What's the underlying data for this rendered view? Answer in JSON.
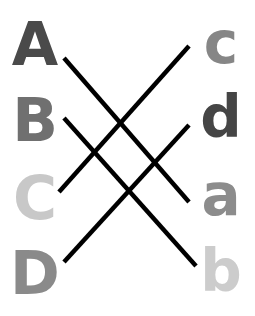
{
  "left_column": [
    {
      "label": "A",
      "color": "#4a4a4a"
    },
    {
      "label": "B",
      "color": "#707070"
    },
    {
      "label": "C",
      "color": "#c8c8c8"
    },
    {
      "label": "D",
      "color": "#8a8a8a"
    }
  ],
  "right_column": [
    {
      "label": "c",
      "color": "#868686"
    },
    {
      "label": "d",
      "color": "#454545"
    },
    {
      "label": "a",
      "color": "#8c8c8c"
    },
    {
      "label": "b",
      "color": "#cccccc"
    }
  ],
  "matches": [
    {
      "from": "A",
      "to": "a",
      "line": {
        "x1": 64,
        "y1": 58,
        "x2": 189,
        "y2": 202
      }
    },
    {
      "from": "B",
      "to": "b",
      "line": {
        "x1": 64,
        "y1": 118,
        "x2": 196,
        "y2": 266
      }
    },
    {
      "from": "C",
      "to": "c",
      "line": {
        "x1": 59,
        "y1": 192,
        "x2": 189,
        "y2": 46
      }
    },
    {
      "from": "D",
      "to": "d",
      "line": {
        "x1": 64,
        "y1": 262,
        "x2": 189,
        "y2": 125
      }
    }
  ],
  "line_color": "#000000"
}
